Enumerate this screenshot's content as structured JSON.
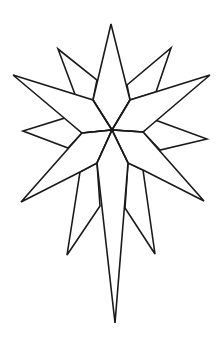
{
  "image": {
    "description": "Line drawing of a multi-pointed Bethlehem-style star with an elongated bottom point",
    "background": "#ffffff",
    "stroke_color": "#1a1a1a"
  }
}
